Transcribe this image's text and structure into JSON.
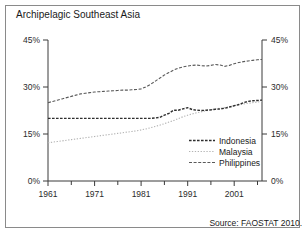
{
  "title": "Archipelagic Southeast Asia",
  "source": "Source: FAOSTAT 2010.",
  "legend": {
    "indonesia": "Indonesia",
    "malaysia": "Malaysia",
    "philippines": "Philippines"
  },
  "axis": {
    "y_ticks": [
      "0%",
      "15%",
      "30%",
      "45%"
    ],
    "y_left_top": "45%",
    "y_left_30": "30%",
    "y_left_15": "15%",
    "y_left_0": "0%",
    "y_right_top": "45%",
    "y_right_30": "30%",
    "y_right_15": "15%",
    "y_right_0": "0%",
    "x_ticks": [
      "1961",
      "1971",
      "1981",
      "1991",
      "2001"
    ]
  },
  "chart_data": {
    "type": "line",
    "title": "Archipelagic Southeast Asia",
    "xlabel": "",
    "ylabel": "",
    "ylim": [
      0,
      45
    ],
    "xlim": [
      1961,
      2007
    ],
    "grid": false,
    "legend_position": "inside-bottom-right",
    "y_tick_values": [
      0,
      15,
      30,
      45
    ],
    "y_tick_labels": [
      "0%",
      "15%",
      "30%",
      "45%"
    ],
    "x_tick_values": [
      1961,
      1971,
      1981,
      1991,
      2001
    ],
    "x_tick_labels": [
      "1961",
      "1971",
      "1981",
      "1991",
      "2001"
    ],
    "x_minor_tick_interval": 5,
    "dual_y_axis": true,
    "annotations": [
      "Source: FAOSTAT 2010."
    ],
    "x": [
      1961,
      1962,
      1963,
      1964,
      1965,
      1966,
      1967,
      1968,
      1969,
      1970,
      1971,
      1972,
      1973,
      1974,
      1975,
      1976,
      1977,
      1978,
      1979,
      1980,
      1981,
      1982,
      1983,
      1984,
      1985,
      1986,
      1987,
      1988,
      1989,
      1990,
      1991,
      1992,
      1993,
      1994,
      1995,
      1996,
      1997,
      1998,
      1999,
      2000,
      2001,
      2002,
      2003,
      2004,
      2005,
      2006,
      2007
    ],
    "series": [
      {
        "name": "Indonesia",
        "style": "dashed",
        "color": "#333333",
        "values": [
          20.0,
          20.0,
          20.0,
          20.0,
          20.0,
          20.0,
          20.0,
          20.0,
          20.0,
          20.0,
          20.0,
          20.0,
          20.0,
          20.0,
          20.0,
          20.0,
          20.0,
          20.0,
          20.0,
          20.0,
          20.0,
          20.0,
          20.0,
          20.1,
          20.3,
          21.0,
          21.6,
          22.6,
          22.6,
          23.0,
          23.4,
          22.8,
          22.6,
          22.5,
          22.6,
          22.7,
          22.9,
          23.0,
          23.2,
          23.6,
          24.0,
          24.4,
          25.0,
          25.4,
          25.6,
          25.7,
          25.8
        ]
      },
      {
        "name": "Malaysia",
        "style": "dotted",
        "color": "#b0b0b0",
        "values": [
          12.2,
          12.4,
          12.6,
          12.8,
          13.0,
          13.2,
          13.4,
          13.6,
          13.8,
          14.0,
          14.2,
          14.4,
          14.6,
          14.8,
          15.0,
          15.2,
          15.4,
          15.6,
          15.8,
          16.0,
          16.3,
          16.6,
          17.0,
          17.4,
          17.8,
          18.3,
          18.8,
          19.3,
          19.9,
          20.5,
          21.0,
          21.4,
          21.8,
          22.1,
          22.4,
          22.7,
          23.0,
          23.2,
          23.4,
          23.7,
          24.0,
          24.3,
          24.6,
          24.8,
          25.0,
          25.2,
          25.4
        ]
      },
      {
        "name": "Philippines",
        "style": "dashed",
        "color": "#555555",
        "values": [
          25.0,
          25.4,
          25.8,
          26.2,
          26.6,
          27.0,
          27.4,
          27.8,
          28.0,
          28.2,
          28.4,
          28.5,
          28.6,
          28.7,
          28.8,
          28.9,
          29.0,
          29.0,
          29.1,
          29.2,
          29.4,
          30.0,
          30.8,
          31.8,
          32.8,
          33.8,
          34.6,
          35.4,
          36.0,
          36.4,
          36.7,
          36.9,
          37.0,
          36.8,
          36.7,
          36.9,
          37.2,
          37.0,
          36.6,
          36.9,
          37.4,
          37.8,
          38.1,
          38.3,
          38.5,
          38.7,
          38.8
        ]
      }
    ]
  }
}
